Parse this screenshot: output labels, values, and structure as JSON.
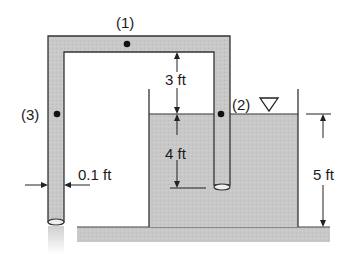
{
  "diagram": {
    "points": {
      "p1": "(1)",
      "p2": "(2)",
      "p3": "(3)"
    },
    "dimensions": {
      "above_surface": "3 ft",
      "below_surface": "4 ft",
      "water_depth": "5 ft",
      "pipe_diameter": "0.1 ft"
    },
    "symbols": {
      "free_surface": "free-surface-triangle"
    },
    "colors": {
      "water": "#c9c9c9",
      "pipe": "#c4c4c4",
      "outline": "#333333",
      "ground": "#cfcfcf",
      "text": "#1a1a1a"
    }
  }
}
